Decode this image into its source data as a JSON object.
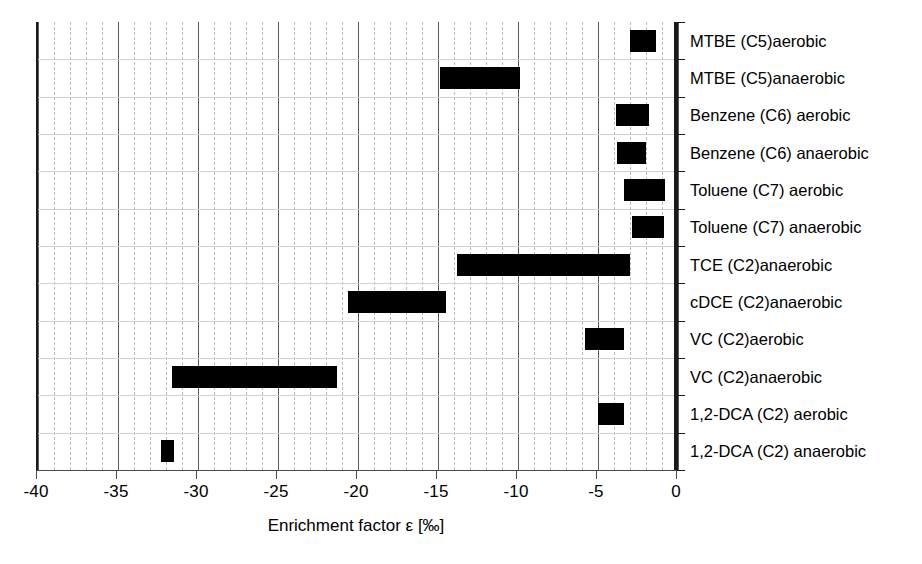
{
  "chart_data": {
    "type": "bar",
    "orientation": "horizontal-range",
    "title": "",
    "xlabel": "Enrichment factor ε [‰]",
    "ylabel": "",
    "xlim": [
      -40,
      0
    ],
    "xticks": [
      -40,
      -35,
      -30,
      -25,
      -20,
      -15,
      -10,
      -5,
      0
    ],
    "xticklabels": [
      "-40",
      "-35",
      "-30",
      "-25",
      "-20",
      "-15",
      "-10",
      "-5",
      "0"
    ],
    "minor_tick_step": 1,
    "grid": "vertical major solid, vertical minor dashed, horizontal row separators",
    "legend": "none",
    "categories": [
      "MTBE (C5)aerobic",
      "MTBE (C5)anaerobic",
      "Benzene (C6) aerobic",
      "Benzene (C6) anaerobic",
      "Toluene (C7) aerobic",
      "Toluene (C7) anaerobic",
      "TCE (C2)anaerobic",
      "cDCE (C2)anaerobic",
      "VC (C2)aerobic",
      "VC (C2)anaerobic",
      "1,2-DCA (C2) aerobic",
      "1,2-DCA (C2) anaerobic"
    ],
    "ranges": [
      {
        "category": "MTBE (C5)aerobic",
        "min": -3.0,
        "max": -1.4
      },
      {
        "category": "MTBE (C5)anaerobic",
        "min": -14.9,
        "max": -9.9
      },
      {
        "category": "Benzene (C6) aerobic",
        "min": -3.9,
        "max": -1.8
      },
      {
        "category": "Benzene (C6) anaerobic",
        "min": -3.8,
        "max": -2.0
      },
      {
        "category": "Toluene (C7) aerobic",
        "min": -3.4,
        "max": -0.8
      },
      {
        "category": "Toluene (C7) anaerobic",
        "min": -2.9,
        "max": -0.9
      },
      {
        "category": "TCE (C2)anaerobic",
        "min": -13.8,
        "max": -3.0
      },
      {
        "category": "cDCE (C2)anaerobic",
        "min": -20.6,
        "max": -14.5
      },
      {
        "category": "VC (C2)aerobic",
        "min": -5.8,
        "max": -3.4
      },
      {
        "category": "VC (C2)anaerobic",
        "min": -31.6,
        "max": -21.3
      },
      {
        "category": "1,2-DCA (C2) aerobic",
        "min": -5.0,
        "max": -3.4
      },
      {
        "category": "1,2-DCA (C2) anaerobic",
        "min": -32.3,
        "max": -31.5
      }
    ],
    "colors": {
      "bar": "#000000",
      "axis": "#1a1a1a",
      "major_grid": "#5a5a5a",
      "minor_grid": "#b9b9b9",
      "row_grid": "#d2d2d2",
      "background": "#ffffff"
    }
  }
}
